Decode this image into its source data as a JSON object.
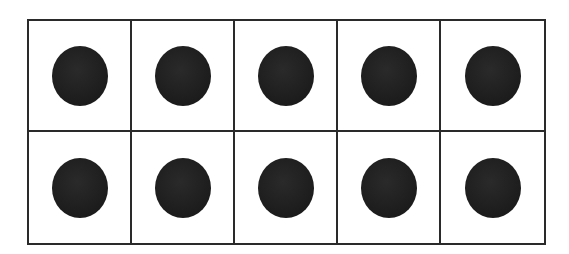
{
  "ten_frame": {
    "rows": 2,
    "columns": 5,
    "filled_count": 10,
    "total_cells": 10,
    "counter_color": "#1c1c1c",
    "border_color": "#2a2a2a",
    "cells": [
      {
        "row": 1,
        "col": 1,
        "filled": true
      },
      {
        "row": 1,
        "col": 2,
        "filled": true
      },
      {
        "row": 1,
        "col": 3,
        "filled": true
      },
      {
        "row": 1,
        "col": 4,
        "filled": true
      },
      {
        "row": 1,
        "col": 5,
        "filled": true
      },
      {
        "row": 2,
        "col": 1,
        "filled": true
      },
      {
        "row": 2,
        "col": 2,
        "filled": true
      },
      {
        "row": 2,
        "col": 3,
        "filled": true
      },
      {
        "row": 2,
        "col": 4,
        "filled": true
      },
      {
        "row": 2,
        "col": 5,
        "filled": true
      }
    ]
  }
}
